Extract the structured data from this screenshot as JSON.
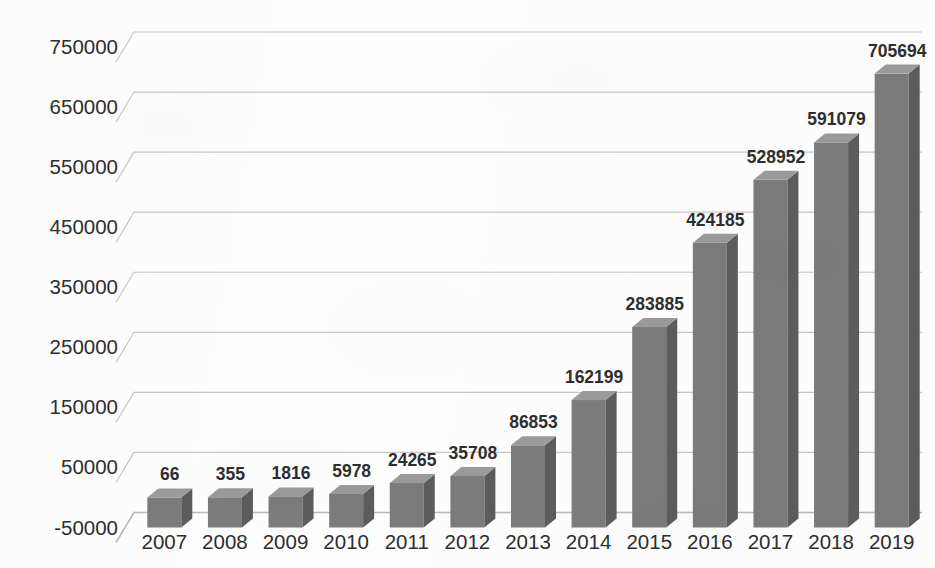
{
  "chart_data": {
    "type": "bar",
    "title": "",
    "subtitle": "",
    "xlabel": "",
    "ylabel": "",
    "categories": [
      "2007",
      "2008",
      "2009",
      "2010",
      "2011",
      "2012",
      "2013",
      "2014",
      "2015",
      "2016",
      "2017",
      "2018",
      "2019"
    ],
    "values": [
      66,
      355,
      1816,
      5978,
      24265,
      35708,
      86853,
      162199,
      283885,
      424185,
      528952,
      591079,
      705694
    ],
    "data_labels": [
      "66",
      "355",
      "1816",
      "5978",
      "24265",
      "35708",
      "86853",
      "162199",
      "283885",
      "424185",
      "528952",
      "591079",
      "705694"
    ],
    "ylim": [
      -50000,
      750000
    ],
    "ytick_labels": [
      "750000",
      "650000",
      "550000",
      "450000",
      "350000",
      "250000",
      "150000",
      "50000",
      "-50000"
    ],
    "ytick_values": [
      750000,
      650000,
      550000,
      450000,
      350000,
      250000,
      150000,
      50000,
      -50000
    ],
    "grid": true,
    "grid_axis": "y",
    "legend": false,
    "legend_position": "none",
    "three_d": true,
    "series": [
      {
        "name": "",
        "values": [
          66,
          355,
          1816,
          5978,
          24265,
          35708,
          86853,
          162199,
          283885,
          424185,
          528952,
          591079,
          705694
        ]
      }
    ]
  },
  "style": {
    "bar_front_color": "#7b7b7b",
    "bar_side_color": "#5c5c5c",
    "bar_top_color": "#9a9a9a",
    "gridline_color": "#c6c6c6",
    "axis_color": "#b9b9b9",
    "text_color": "#2e2e2e",
    "background_color": "#fdfdfd"
  },
  "axis": {
    "y_min_label": "-50000",
    "y_max_label": "750000"
  }
}
